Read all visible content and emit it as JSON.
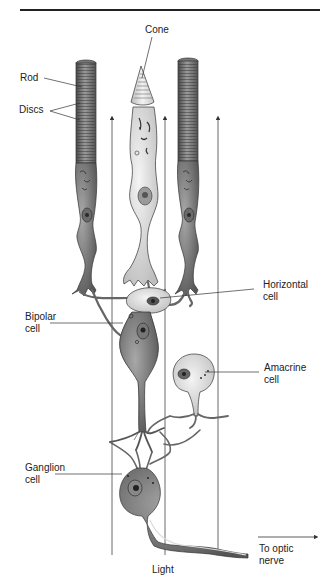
{
  "figure": {
    "labels": {
      "cone": "Cone",
      "rod": "Rod",
      "discs": "Discs",
      "horizontal_cell": [
        "Horizontal",
        "cell"
      ],
      "bipolar_cell": [
        "Bipolar",
        "cell"
      ],
      "amacrine_cell": [
        "Amacrine",
        "cell"
      ],
      "ganglion_cell": [
        "Ganglion",
        "cell"
      ],
      "light": "Light",
      "optic_nerve": [
        "To optic",
        "nerve"
      ]
    },
    "colors": {
      "line": "#333333",
      "rod_fill": "#8a8a8a",
      "rod_dark": "#5a5a5a",
      "cone_fill": "#e6e6e6",
      "cell_light": "#dcdcdc",
      "cell_dark": "#7a7a7a",
      "nucleus": "#444444",
      "background": "#ffffff"
    }
  }
}
